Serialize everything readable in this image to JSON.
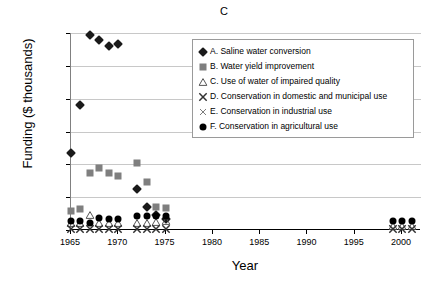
{
  "chart_data": {
    "type": "scatter",
    "title": "C",
    "xlabel": "Year",
    "ylabel": "Funding ($ thousands)",
    "xlim": [
      1965,
      2002
    ],
    "ylim": [
      0,
      120000
    ],
    "xticks": [
      1965,
      1970,
      1975,
      1980,
      1985,
      1990,
      1995,
      2000
    ],
    "xtick_labels": [
      "1965",
      "1970",
      "1975",
      "1980",
      "1985",
      "1990",
      "1995",
      "2000"
    ],
    "yticks": [
      0,
      20000,
      40000,
      60000,
      80000,
      100000,
      120000
    ],
    "ytick_labels": [
      "0",
      "20,000",
      "40,000",
      "60,000",
      "80,000",
      "100,000",
      "120,000"
    ],
    "grid": "horizontal",
    "legend_position": "upper-center-right",
    "series": [
      {
        "key": "A",
        "name": "A. Saline water conversion",
        "marker": "diamond",
        "color": "#1a1a1a",
        "points": [
          {
            "x": 1965,
            "y": 47000
          },
          {
            "x": 1966,
            "y": 76000
          },
          {
            "x": 1967,
            "y": 119000
          },
          {
            "x": 1968,
            "y": 116000
          },
          {
            "x": 1969,
            "y": 112000
          },
          {
            "x": 1970,
            "y": 113000
          },
          {
            "x": 1972,
            "y": 25000
          },
          {
            "x": 1973,
            "y": 14000
          },
          {
            "x": 1974,
            "y": 9000
          },
          {
            "x": 1975,
            "y": 7000
          }
        ]
      },
      {
        "key": "B",
        "name": "B. Water yield improvement",
        "marker": "square",
        "color": "#7f7f7f",
        "points": [
          {
            "x": 1965,
            "y": 11500
          },
          {
            "x": 1966,
            "y": 12500
          },
          {
            "x": 1967,
            "y": 34500
          },
          {
            "x": 1968,
            "y": 37500
          },
          {
            "x": 1969,
            "y": 35000
          },
          {
            "x": 1970,
            "y": 33000
          },
          {
            "x": 1972,
            "y": 41000
          },
          {
            "x": 1973,
            "y": 29000
          },
          {
            "x": 1974,
            "y": 14000
          },
          {
            "x": 1975,
            "y": 13500
          }
        ]
      },
      {
        "key": "C",
        "name": "C. Use of water of impaired quality",
        "marker": "triangle",
        "color": "#555555",
        "points": [
          {
            "x": 1965,
            "y": 4500
          },
          {
            "x": 1966,
            "y": 4000
          },
          {
            "x": 1967,
            "y": 9000
          },
          {
            "x": 1968,
            "y": 4500
          },
          {
            "x": 1969,
            "y": 4500
          },
          {
            "x": 1970,
            "y": 4500
          },
          {
            "x": 1972,
            "y": 4500
          },
          {
            "x": 1973,
            "y": 4500
          },
          {
            "x": 1974,
            "y": 5000
          },
          {
            "x": 1975,
            "y": 5500
          },
          {
            "x": 1999,
            "y": 2500
          },
          {
            "x": 2000,
            "y": 2500
          },
          {
            "x": 2001,
            "y": 2500
          }
        ]
      },
      {
        "key": "D",
        "name": "D. Conservation in domestic and municipal use",
        "marker": "x-bold",
        "color": "#333333",
        "points": [
          {
            "x": 1965,
            "y": 500
          },
          {
            "x": 1966,
            "y": 500
          },
          {
            "x": 1967,
            "y": 500
          },
          {
            "x": 1968,
            "y": 500
          },
          {
            "x": 1969,
            "y": 500
          },
          {
            "x": 1970,
            "y": 500
          },
          {
            "x": 1972,
            "y": 700
          },
          {
            "x": 1973,
            "y": 700
          },
          {
            "x": 1974,
            "y": 700
          },
          {
            "x": 1975,
            "y": 700
          },
          {
            "x": 1999,
            "y": 600
          },
          {
            "x": 2000,
            "y": 600
          },
          {
            "x": 2001,
            "y": 600
          }
        ]
      },
      {
        "key": "E",
        "name": "E. Conservation in industrial use",
        "marker": "x-thin",
        "color": "#5a5a5a",
        "points": [
          {
            "x": 1965,
            "y": 400
          },
          {
            "x": 1966,
            "y": 400
          },
          {
            "x": 1967,
            "y": 400
          },
          {
            "x": 1968,
            "y": 400
          },
          {
            "x": 1969,
            "y": 400
          },
          {
            "x": 1970,
            "y": 400
          },
          {
            "x": 1972,
            "y": 500
          },
          {
            "x": 1973,
            "y": 500
          },
          {
            "x": 1974,
            "y": 500
          },
          {
            "x": 1975,
            "y": 500
          },
          {
            "x": 1999,
            "y": 450
          },
          {
            "x": 2000,
            "y": 450
          },
          {
            "x": 2001,
            "y": 450
          }
        ]
      },
      {
        "key": "F",
        "name": "F. Conservation in agricultural use",
        "marker": "circle",
        "color": "#000000",
        "points": [
          {
            "x": 1965,
            "y": 5500
          },
          {
            "x": 1966,
            "y": 5500
          },
          {
            "x": 1967,
            "y": 4000
          },
          {
            "x": 1968,
            "y": 7500
          },
          {
            "x": 1969,
            "y": 7000
          },
          {
            "x": 1970,
            "y": 7000
          },
          {
            "x": 1972,
            "y": 8500
          },
          {
            "x": 1973,
            "y": 8500
          },
          {
            "x": 1974,
            "y": 8500
          },
          {
            "x": 1975,
            "y": 8500
          },
          {
            "x": 1999,
            "y": 5500
          },
          {
            "x": 2000,
            "y": 5500
          },
          {
            "x": 2001,
            "y": 5500
          }
        ]
      }
    ]
  }
}
